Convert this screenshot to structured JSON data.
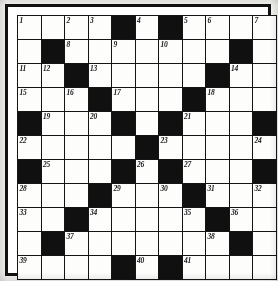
{
  "puzzle": {
    "type": "crossword-grid",
    "title": "Crossword Puzzle Grid",
    "columns": 11,
    "rows": 11,
    "colors": {
      "block": "#101010",
      "cell": "#fdfdfb",
      "border": "#141414",
      "page": "#f2f1ee"
    },
    "legend": {
      "white_cell": "fillable-letter-square",
      "black_cell": "block-square"
    },
    "clue_number_count": 41,
    "grid": [
      [
        {
          "block": false,
          "num": "1"
        },
        {
          "block": false,
          "num": ""
        },
        {
          "block": false,
          "num": "2"
        },
        {
          "block": false,
          "num": "3"
        },
        {
          "block": true,
          "num": ""
        },
        {
          "block": false,
          "num": "4"
        },
        {
          "block": true,
          "num": ""
        },
        {
          "block": false,
          "num": "5"
        },
        {
          "block": false,
          "num": "6"
        },
        {
          "block": false,
          "num": ""
        },
        {
          "block": false,
          "num": "7"
        }
      ],
      [
        {
          "block": false,
          "num": ""
        },
        {
          "block": true,
          "num": ""
        },
        {
          "block": false,
          "num": "8"
        },
        {
          "block": false,
          "num": ""
        },
        {
          "block": false,
          "num": "9"
        },
        {
          "block": false,
          "num": ""
        },
        {
          "block": false,
          "num": "10"
        },
        {
          "block": false,
          "num": ""
        },
        {
          "block": false,
          "num": ""
        },
        {
          "block": true,
          "num": ""
        },
        {
          "block": false,
          "num": ""
        }
      ],
      [
        {
          "block": false,
          "num": "11"
        },
        {
          "block": false,
          "num": "12"
        },
        {
          "block": true,
          "num": ""
        },
        {
          "block": false,
          "num": "13"
        },
        {
          "block": false,
          "num": ""
        },
        {
          "block": false,
          "num": ""
        },
        {
          "block": false,
          "num": ""
        },
        {
          "block": false,
          "num": ""
        },
        {
          "block": true,
          "num": ""
        },
        {
          "block": false,
          "num": "14"
        },
        {
          "block": false,
          "num": ""
        }
      ],
      [
        {
          "block": false,
          "num": "15"
        },
        {
          "block": false,
          "num": ""
        },
        {
          "block": false,
          "num": "16"
        },
        {
          "block": true,
          "num": ""
        },
        {
          "block": false,
          "num": "17"
        },
        {
          "block": false,
          "num": ""
        },
        {
          "block": false,
          "num": ""
        },
        {
          "block": true,
          "num": ""
        },
        {
          "block": false,
          "num": "18"
        },
        {
          "block": false,
          "num": ""
        },
        {
          "block": false,
          "num": ""
        }
      ],
      [
        {
          "block": true,
          "num": ""
        },
        {
          "block": false,
          "num": "19"
        },
        {
          "block": false,
          "num": ""
        },
        {
          "block": false,
          "num": "20"
        },
        {
          "block": true,
          "num": ""
        },
        {
          "block": false,
          "num": ""
        },
        {
          "block": true,
          "num": ""
        },
        {
          "block": false,
          "num": "21"
        },
        {
          "block": false,
          "num": ""
        },
        {
          "block": false,
          "num": ""
        },
        {
          "block": true,
          "num": ""
        }
      ],
      [
        {
          "block": false,
          "num": "22"
        },
        {
          "block": false,
          "num": ""
        },
        {
          "block": false,
          "num": ""
        },
        {
          "block": false,
          "num": ""
        },
        {
          "block": false,
          "num": ""
        },
        {
          "block": true,
          "num": ""
        },
        {
          "block": false,
          "num": "23"
        },
        {
          "block": false,
          "num": ""
        },
        {
          "block": false,
          "num": ""
        },
        {
          "block": false,
          "num": ""
        },
        {
          "block": false,
          "num": "24"
        }
      ],
      [
        {
          "block": true,
          "num": ""
        },
        {
          "block": false,
          "num": "25"
        },
        {
          "block": false,
          "num": ""
        },
        {
          "block": false,
          "num": ""
        },
        {
          "block": true,
          "num": ""
        },
        {
          "block": false,
          "num": "26"
        },
        {
          "block": true,
          "num": ""
        },
        {
          "block": false,
          "num": "27"
        },
        {
          "block": false,
          "num": ""
        },
        {
          "block": false,
          "num": ""
        },
        {
          "block": true,
          "num": ""
        }
      ],
      [
        {
          "block": false,
          "num": "28"
        },
        {
          "block": false,
          "num": ""
        },
        {
          "block": false,
          "num": ""
        },
        {
          "block": true,
          "num": ""
        },
        {
          "block": false,
          "num": "29"
        },
        {
          "block": false,
          "num": ""
        },
        {
          "block": false,
          "num": "30"
        },
        {
          "block": true,
          "num": ""
        },
        {
          "block": false,
          "num": "31"
        },
        {
          "block": false,
          "num": ""
        },
        {
          "block": false,
          "num": "32"
        }
      ],
      [
        {
          "block": false,
          "num": "33"
        },
        {
          "block": false,
          "num": ""
        },
        {
          "block": true,
          "num": ""
        },
        {
          "block": false,
          "num": "34"
        },
        {
          "block": false,
          "num": ""
        },
        {
          "block": false,
          "num": ""
        },
        {
          "block": false,
          "num": ""
        },
        {
          "block": false,
          "num": "35"
        },
        {
          "block": true,
          "num": ""
        },
        {
          "block": false,
          "num": "36"
        },
        {
          "block": false,
          "num": ""
        }
      ],
      [
        {
          "block": false,
          "num": ""
        },
        {
          "block": true,
          "num": ""
        },
        {
          "block": false,
          "num": "37"
        },
        {
          "block": false,
          "num": ""
        },
        {
          "block": false,
          "num": ""
        },
        {
          "block": false,
          "num": ""
        },
        {
          "block": false,
          "num": ""
        },
        {
          "block": false,
          "num": ""
        },
        {
          "block": false,
          "num": "38"
        },
        {
          "block": true,
          "num": ""
        },
        {
          "block": false,
          "num": ""
        }
      ],
      [
        {
          "block": false,
          "num": "39"
        },
        {
          "block": false,
          "num": ""
        },
        {
          "block": false,
          "num": ""
        },
        {
          "block": false,
          "num": ""
        },
        {
          "block": true,
          "num": ""
        },
        {
          "block": false,
          "num": "40"
        },
        {
          "block": true,
          "num": ""
        },
        {
          "block": false,
          "num": "41"
        },
        {
          "block": false,
          "num": ""
        },
        {
          "block": false,
          "num": ""
        },
        {
          "block": false,
          "num": ""
        }
      ]
    ]
  }
}
